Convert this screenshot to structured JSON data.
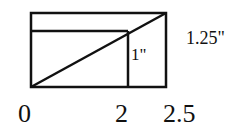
{
  "diagram": {
    "shapes": {
      "outer_rect": {
        "width_in": 2.5,
        "height_in": 1.25
      },
      "inner_rect": {
        "width_in": 2,
        "height_in": 1
      }
    },
    "labels": {
      "outer_height": "1.25\"",
      "inner_height": "1\"",
      "x_origin": "0",
      "x_inner": "2",
      "x_outer": "2.5"
    },
    "colors": {
      "stroke": "#111111",
      "background": "#ffffff"
    }
  }
}
